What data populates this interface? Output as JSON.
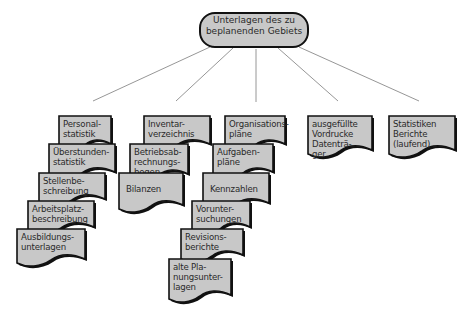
{
  "diagram": {
    "type": "hierarchy",
    "root": {
      "label_line1": "Unterlagen des zu",
      "label_line2": "beplanenden Gebiets"
    },
    "colors": {
      "fill": "#c8c8c8",
      "stroke": "#111111",
      "line": "#888888",
      "background": "#ffffff"
    },
    "columns": [
      {
        "id": "col1",
        "documents": [
          {
            "label": "Personal-\nstatistik"
          },
          {
            "label": "Überstunden-\nstatistik"
          },
          {
            "label": "Stellenbe-\nschreibung"
          },
          {
            "label": "Arbeitsplatz-\nbeschreibung"
          },
          {
            "label": "Ausbildungs-\nunterlagen"
          }
        ]
      },
      {
        "id": "col2",
        "documents": [
          {
            "label": "Inventar-\nverzeichnis"
          },
          {
            "label": "Betriebsab-\nrechnungs-\nbogen"
          },
          {
            "label": "Bilanzen"
          }
        ]
      },
      {
        "id": "col3",
        "documents": [
          {
            "label": "Organisations-\npläne"
          },
          {
            "label": "Aufgaben-\npläne"
          },
          {
            "label": "Kennzahlen"
          },
          {
            "label": "Vorunter-\nsuchungen"
          },
          {
            "label": "Revisions-\nberichte"
          },
          {
            "label": "alte Pla-\nnungsunter-\nlagen"
          }
        ]
      },
      {
        "id": "col4",
        "documents": [
          {
            "label": "ausgefüllte\nVordrucke\nDatenträ-\nger"
          }
        ]
      },
      {
        "id": "col5",
        "documents": [
          {
            "label": "Statistiken\nBerichte\n(laufend)"
          }
        ]
      }
    ]
  }
}
